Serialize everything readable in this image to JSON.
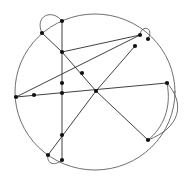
{
  "figure": {
    "title": "",
    "type": "graph-drawing",
    "width": 189,
    "height": 179,
    "background_color": "#ffffff",
    "edge_color": "#4a4a4a",
    "chord_color": "#2b2b2b",
    "vertex_color": "#111111",
    "vertex_radius": 2.1,
    "vertex_count": 16,
    "edge_count": 21
  },
  "chart_data": {
    "type": "scatter",
    "title": "",
    "xlabel": "",
    "ylabel": "",
    "xlim": [
      0,
      189
    ],
    "ylim": [
      0,
      179
    ],
    "grid": false,
    "legend": "none",
    "vertices": [
      {
        "id": "v1",
        "label": "",
        "x": 62,
        "y": 21
      },
      {
        "id": "v2",
        "label": "",
        "x": 42,
        "y": 33
      },
      {
        "id": "v3",
        "label": "",
        "x": 62,
        "y": 52
      },
      {
        "id": "v4",
        "label": "",
        "x": 82,
        "y": 73
      },
      {
        "id": "v5",
        "label": "",
        "x": 62,
        "y": 83
      },
      {
        "id": "v6",
        "label": "",
        "x": 62,
        "y": 93
      },
      {
        "id": "v7",
        "label": "",
        "x": 16,
        "y": 97
      },
      {
        "id": "v8",
        "label": "",
        "x": 34,
        "y": 95
      },
      {
        "id": "v9",
        "label": "",
        "x": 96,
        "y": 91
      },
      {
        "id": "v10",
        "label": "",
        "x": 167,
        "y": 83
      },
      {
        "id": "v11",
        "label": "",
        "x": 140,
        "y": 35
      },
      {
        "id": "v12",
        "label": "",
        "x": 148,
        "y": 39
      },
      {
        "id": "v13",
        "label": "",
        "x": 135,
        "y": 46
      },
      {
        "id": "v14",
        "label": "",
        "x": 148,
        "y": 140
      },
      {
        "id": "v15",
        "label": "",
        "x": 62,
        "y": 135
      },
      {
        "id": "v16",
        "label": "",
        "x": 48,
        "y": 155
      },
      {
        "id": "v17",
        "label": "",
        "x": 62,
        "y": 160
      }
    ],
    "edges": [
      {
        "from": "v1",
        "to": "v2",
        "kind": "chord"
      },
      {
        "from": "v1",
        "to": "v3",
        "kind": "chord"
      },
      {
        "from": "v3",
        "to": "v5",
        "kind": "chord"
      },
      {
        "from": "v5",
        "to": "v6",
        "kind": "chord"
      },
      {
        "from": "v6",
        "to": "v15",
        "kind": "chord"
      },
      {
        "from": "v15",
        "to": "v17",
        "kind": "chord"
      },
      {
        "from": "v2",
        "to": "v3",
        "kind": "chord"
      },
      {
        "from": "v3",
        "to": "v4",
        "kind": "chord"
      },
      {
        "from": "v4",
        "to": "v9",
        "kind": "chord"
      },
      {
        "from": "v9",
        "to": "v13",
        "kind": "chord"
      },
      {
        "from": "v13",
        "to": "v11",
        "kind": "chord"
      },
      {
        "from": "v7",
        "to": "v8",
        "kind": "chord"
      },
      {
        "from": "v8",
        "to": "v9",
        "kind": "chord"
      },
      {
        "from": "v9",
        "to": "v10",
        "kind": "chord"
      },
      {
        "from": "v7",
        "to": "v4",
        "kind": "chord"
      },
      {
        "from": "v9",
        "to": "v14",
        "kind": "chord"
      },
      {
        "from": "v9",
        "to": "v16",
        "kind": "chord"
      },
      {
        "from": "v2",
        "to": "v1",
        "kind": "loop-arc"
      },
      {
        "from": "v11",
        "to": "v12",
        "kind": "loop-arc"
      },
      {
        "from": "v16",
        "to": "v17",
        "kind": "loop-arc"
      },
      {
        "from": "v10",
        "to": "v14",
        "kind": "lens-arc"
      }
    ],
    "outer_circle": {
      "cx": 95,
      "cy": 92,
      "rx": 80,
      "ry": 78
    }
  }
}
